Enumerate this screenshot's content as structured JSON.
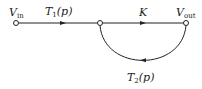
{
  "diagram": {
    "type": "signal-flow-graph",
    "nodes": [
      {
        "id": "vin",
        "label": "V",
        "subscript": "in",
        "x": 16,
        "y": 23
      },
      {
        "id": "mid",
        "label": "",
        "x": 100,
        "y": 23
      },
      {
        "id": "vout",
        "label": "V",
        "subscript": "out",
        "x": 186,
        "y": 23
      }
    ],
    "branches": [
      {
        "from": "vin",
        "to": "mid",
        "gain": "T",
        "gain_sub": "1",
        "gain_arg": "(p)"
      },
      {
        "from": "mid",
        "to": "vout",
        "gain": "K",
        "gain_sub": "",
        "gain_arg": ""
      },
      {
        "from": "vout",
        "to": "mid",
        "gain": "T",
        "gain_sub": "2",
        "gain_arg": "(p)",
        "shape": "lower-arc"
      }
    ],
    "colors": {
      "line": "#222222",
      "node_fill": "#ffffff"
    }
  }
}
